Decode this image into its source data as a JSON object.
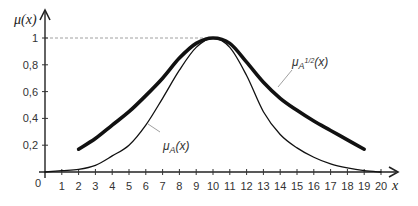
{
  "chart_data": {
    "type": "line",
    "title": "",
    "xlabel": "x",
    "ylabel": "μ(x)",
    "xlim": [
      0,
      20
    ],
    "ylim": [
      0,
      1
    ],
    "x_ticks": [
      1,
      2,
      3,
      4,
      5,
      6,
      7,
      8,
      9,
      10,
      11,
      12,
      13,
      14,
      15,
      16,
      17,
      18,
      19,
      20
    ],
    "y_ticks": [
      "0,2",
      "0,4",
      "0,6",
      "0,8",
      "1"
    ],
    "origin_label": "0",
    "grid": false,
    "reference_line": {
      "y": 1,
      "style": "dashed",
      "x_to": 10
    },
    "series": [
      {
        "name": "μA(x)",
        "label_main": "μ",
        "label_sub": "A",
        "label_tail": "(x)",
        "style": "thin",
        "x": [
          0,
          1,
          2,
          3,
          4,
          5,
          6,
          7,
          8,
          9,
          10,
          11,
          12,
          13,
          14,
          15,
          16,
          17,
          18,
          19,
          20
        ],
        "values": [
          0,
          0.01,
          0.02,
          0.05,
          0.12,
          0.2,
          0.35,
          0.55,
          0.76,
          0.93,
          1.0,
          0.93,
          0.72,
          0.45,
          0.28,
          0.18,
          0.11,
          0.06,
          0.03,
          0.01,
          0
        ]
      },
      {
        "name": "μA^1/2(x)",
        "label_main": "μ",
        "label_sub": "A",
        "label_sup": "1/2",
        "label_tail": "(x)",
        "style": "thick",
        "x": [
          2,
          3,
          4,
          5,
          6,
          7,
          8,
          9,
          10,
          11,
          12,
          13,
          14,
          15,
          16,
          17,
          18,
          19
        ],
        "values": [
          0.17,
          0.25,
          0.35,
          0.45,
          0.57,
          0.7,
          0.85,
          0.96,
          1.0,
          0.96,
          0.82,
          0.67,
          0.55,
          0.46,
          0.38,
          0.31,
          0.24,
          0.17
        ]
      }
    ]
  }
}
